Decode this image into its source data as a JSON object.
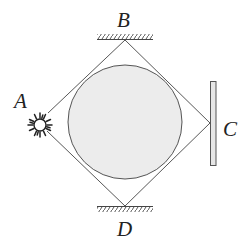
{
  "diagram": {
    "labels": {
      "A": "A",
      "B": "B",
      "C": "C",
      "D": "D"
    },
    "elements": {
      "source": "light-source at A",
      "mirror_B": "fixed surface at B",
      "mirror_D": "fixed surface at D",
      "screen_C": "plate at C",
      "sphere": "shaded circle"
    },
    "colors": {
      "stroke": "#444444",
      "circle_fill": "#ececec",
      "plate_fill": "#e6e6e6"
    }
  }
}
